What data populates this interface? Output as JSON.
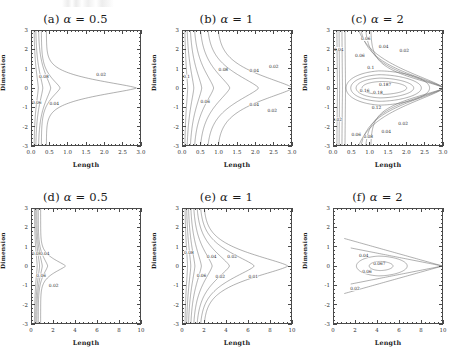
{
  "figure": {
    "axis_titles": {
      "x": "Length",
      "y": "Dimension"
    },
    "panels": [
      {
        "id": "a",
        "tag": "(a)",
        "param_name": "α",
        "param_value": "0.5",
        "title": "(a) α = 0.5",
        "xlim": [
          0.0,
          3.0
        ],
        "ylim": [
          -3,
          3
        ],
        "xticks": [
          "0.0",
          "0.5",
          "1.0",
          "1.5",
          "2.0",
          "2.5",
          "3.0"
        ],
        "xtick_values": [
          0.0,
          0.5,
          1.0,
          1.5,
          2.0,
          2.5,
          3.0
        ],
        "yticks": [
          "3",
          "2",
          "1",
          "0",
          "-1",
          "-2",
          "-3"
        ],
        "ytick_values": [
          3,
          2,
          1,
          0,
          -1,
          -2,
          -3
        ],
        "contour_levels": [
          0.02,
          0.04,
          0.06,
          0.08
        ],
        "labels": [
          {
            "text": "0.08",
            "x": 0.33,
            "y": 0.62
          },
          {
            "text": "0.06",
            "x": 0.13,
            "y": -0.75
          },
          {
            "text": "0.04",
            "x": 0.62,
            "y": -0.82
          },
          {
            "text": "0.02",
            "x": 1.92,
            "y": 0.72
          }
        ]
      },
      {
        "id": "b",
        "tag": "(b)",
        "param_name": "α",
        "param_value": "1",
        "title": "(b) α = 1",
        "xlim": [
          0.0,
          3.0
        ],
        "ylim": [
          -3,
          3
        ],
        "xticks": [
          "0.0",
          "0.5",
          "1.0",
          "1.5",
          "2.0",
          "2.5",
          "3.0"
        ],
        "xtick_values": [
          0.0,
          0.5,
          1.0,
          1.5,
          2.0,
          2.5,
          3.0
        ],
        "yticks": [
          "3",
          "2",
          "1",
          "0",
          "-1",
          "-2",
          "-3"
        ],
        "ytick_values": [
          3,
          2,
          1,
          0,
          -1,
          -2,
          -3
        ],
        "contour_levels": [
          0.02,
          0.04,
          0.06,
          0.08,
          0.1
        ],
        "labels": [
          {
            "text": "0.1",
            "x": 0.1,
            "y": 0.6
          },
          {
            "text": "0.08",
            "x": 1.12,
            "y": 0.95
          },
          {
            "text": "0.06",
            "x": 0.62,
            "y": -0.72
          },
          {
            "text": "0.04",
            "x": 1.98,
            "y": 0.92
          },
          {
            "text": "0.02",
            "x": 2.52,
            "y": 1.12
          },
          {
            "text": "0.04",
            "x": 1.98,
            "y": -0.88
          },
          {
            "text": "0.02",
            "x": 2.48,
            "y": -1.2
          }
        ]
      },
      {
        "id": "c",
        "tag": "(c)",
        "param_name": "α",
        "param_value": "2",
        "title": "(c) α = 2",
        "xlim": [
          0.0,
          3.0
        ],
        "ylim": [
          -3,
          3
        ],
        "xticks": [
          "0.0",
          "0.5",
          "1.0",
          "1.5",
          "2.0",
          "2.5",
          "3.0"
        ],
        "xtick_values": [
          0.0,
          0.5,
          1.0,
          1.5,
          2.0,
          2.5,
          3.0
        ],
        "yticks": [
          "3",
          "2",
          "1",
          "0",
          "-1",
          "-2",
          "-3"
        ],
        "ytick_values": [
          3,
          2,
          1,
          0,
          -1,
          -2,
          -3
        ],
        "contour_levels": [
          0.02,
          0.04,
          0.06,
          0.08,
          0.1,
          0.12,
          0.14,
          0.16,
          0.18,
          0.187
        ],
        "labels": [
          {
            "text": "0.04",
            "x": 0.13,
            "y": 2.05
          },
          {
            "text": "0.02",
            "x": 0.09,
            "y": -1.65
          },
          {
            "text": "0.06",
            "x": 0.88,
            "y": 2.58
          },
          {
            "text": "0.06",
            "x": 0.72,
            "y": 1.72
          },
          {
            "text": "0.04",
            "x": 1.38,
            "y": 2.18
          },
          {
            "text": "0.02",
            "x": 1.95,
            "y": 1.95
          },
          {
            "text": "0.1",
            "x": 1.02,
            "y": 1.08
          },
          {
            "text": "0.16",
            "x": 0.85,
            "y": -0.12
          },
          {
            "text": "0.187",
            "x": 1.42,
            "y": 0.2
          },
          {
            "text": "0.18",
            "x": 1.22,
            "y": -0.25
          },
          {
            "text": "0.12",
            "x": 1.18,
            "y": -1.05
          },
          {
            "text": "0.06",
            "x": 0.62,
            "y": -2.45
          },
          {
            "text": "0.08",
            "x": 0.95,
            "y": -2.58
          },
          {
            "text": "0.04",
            "x": 1.45,
            "y": -2.3
          },
          {
            "text": "0.02",
            "x": 1.92,
            "y": -1.85
          }
        ]
      },
      {
        "id": "d",
        "tag": "(d)",
        "param_name": "α",
        "param_value": "0.5",
        "title": "(d) α = 0.5",
        "xlim": [
          0,
          10
        ],
        "ylim": [
          -3,
          3
        ],
        "xticks": [
          "0",
          "2",
          "4",
          "6",
          "8",
          "10"
        ],
        "xtick_values": [
          0,
          2,
          4,
          6,
          8,
          10
        ],
        "yticks": [
          "3",
          "2",
          "1",
          "0",
          "-1",
          "-2",
          "-3"
        ],
        "ytick_values": [
          3,
          2,
          1,
          0,
          -1,
          -2,
          -3
        ],
        "contour_levels": [
          0.02,
          0.04,
          0.06,
          0.08
        ],
        "labels": [
          {
            "text": "0.08",
            "x": 0.42,
            "y": 0.65
          },
          {
            "text": "0.04",
            "x": 1.18,
            "y": 0.65
          },
          {
            "text": "0.06",
            "x": 0.85,
            "y": -0.5
          },
          {
            "text": "0.02",
            "x": 2.0,
            "y": -1.05
          }
        ]
      },
      {
        "id": "e",
        "tag": "(e)",
        "param_name": "α",
        "param_value": "1",
        "title": "(e) α = 1",
        "xlim": [
          0,
          10
        ],
        "ylim": [
          -3,
          3
        ],
        "xticks": [
          "0",
          "2",
          "4",
          "6",
          "8",
          "10"
        ],
        "xtick_values": [
          0,
          2,
          4,
          6,
          8,
          10
        ],
        "yticks": [
          "3",
          "2",
          "1",
          "0",
          "-1",
          "-2",
          "-3"
        ],
        "ytick_values": [
          3,
          2,
          1,
          0,
          -1,
          -2,
          -3
        ],
        "contour_levels": [
          0.01,
          0.02,
          0.04,
          0.06,
          0.08
        ],
        "labels": [
          {
            "text": "0.08",
            "x": 0.55,
            "y": 0.72
          },
          {
            "text": "0.04",
            "x": 2.65,
            "y": 0.48
          },
          {
            "text": "0.02",
            "x": 4.55,
            "y": 0.5
          },
          {
            "text": "0.06",
            "x": 1.72,
            "y": -0.5
          },
          {
            "text": "0.02",
            "x": 3.45,
            "y": -0.55
          },
          {
            "text": "0.01",
            "x": 6.5,
            "y": -0.55
          }
        ]
      },
      {
        "id": "f",
        "tag": "(f)",
        "param_name": "α",
        "param_value": "2",
        "title": "(f) α = 2",
        "xlim": [
          0,
          10
        ],
        "ylim": [
          -3,
          3
        ],
        "xticks": [
          "0",
          "2",
          "4",
          "6",
          "8",
          "10"
        ],
        "xtick_values": [
          0,
          2,
          4,
          6,
          8,
          10
        ],
        "yticks": [
          "3",
          "2",
          "1",
          "0",
          "-1",
          "-2",
          "-3"
        ],
        "ytick_values": [
          3,
          2,
          1,
          0,
          -1,
          -2,
          -3
        ],
        "contour_levels": [
          0.02,
          0.04,
          0.06,
          0.067
        ],
        "labels": [
          {
            "text": "0.04",
            "x": 2.75,
            "y": 0.55
          },
          {
            "text": "0.067",
            "x": 4.2,
            "y": 0.12
          },
          {
            "text": "0.06",
            "x": 3.05,
            "y": -0.3
          },
          {
            "text": "0.02",
            "x": 1.95,
            "y": -1.2
          }
        ]
      }
    ]
  },
  "chart_data": {
    "type": "line",
    "title": "",
    "xlabel": "Length",
    "ylabel": "Dimension",
    "grid": false,
    "legend_position": "none",
    "panels": [
      {
        "id": "a",
        "title": "(a) α = 0.5",
        "alpha": 0.5,
        "xlim": [
          0.0,
          3.0
        ],
        "ylim": [
          -3,
          3
        ],
        "xticks": [
          0.0,
          0.5,
          1.0,
          1.5,
          2.0,
          2.5,
          3.0
        ],
        "yticks": [
          3,
          2,
          1,
          0,
          -1,
          -2,
          -3
        ],
        "contour_levels": [
          0.02,
          0.04,
          0.06,
          0.08
        ],
        "peak_value": 0.08,
        "peak_location": [
          0.0,
          0.0
        ],
        "outermost_extent_x": 2.9
      },
      {
        "id": "b",
        "title": "(b) α = 1",
        "alpha": 1,
        "xlim": [
          0.0,
          3.0
        ],
        "ylim": [
          -3,
          3
        ],
        "xticks": [
          0.0,
          0.5,
          1.0,
          1.5,
          2.0,
          2.5,
          3.0
        ],
        "yticks": [
          3,
          2,
          1,
          0,
          -1,
          -2,
          -3
        ],
        "contour_levels": [
          0.02,
          0.04,
          0.06,
          0.08,
          0.1
        ],
        "peak_value": 0.1,
        "peak_location": [
          0.1,
          0.0
        ],
        "outermost_extent_x": 3.0
      },
      {
        "id": "c",
        "title": "(c) α = 2",
        "alpha": 2,
        "xlim": [
          0.0,
          3.0
        ],
        "ylim": [
          -3,
          3
        ],
        "xticks": [
          0.0,
          0.5,
          1.0,
          1.5,
          2.0,
          2.5,
          3.0
        ],
        "yticks": [
          3,
          2,
          1,
          0,
          -1,
          -2,
          -3
        ],
        "contour_levels": [
          0.02,
          0.04,
          0.06,
          0.08,
          0.1,
          0.12,
          0.14,
          0.16,
          0.18,
          0.187
        ],
        "peak_value": 0.187,
        "peak_location": [
          1.35,
          0.0
        ],
        "outermost_extent_x": 3.0
      },
      {
        "id": "d",
        "title": "(d) α = 0.5",
        "alpha": 0.5,
        "xlim": [
          0,
          10
        ],
        "ylim": [
          -3,
          3
        ],
        "xticks": [
          0,
          2,
          4,
          6,
          8,
          10
        ],
        "yticks": [
          3,
          2,
          1,
          0,
          -1,
          -2,
          -3
        ],
        "contour_levels": [
          0.02,
          0.04,
          0.06,
          0.08
        ],
        "peak_value": 0.08,
        "peak_location": [
          0.3,
          0.0
        ],
        "outermost_extent_x": 3.1
      },
      {
        "id": "e",
        "title": "(e) α = 1",
        "alpha": 1,
        "xlim": [
          0,
          10
        ],
        "ylim": [
          -3,
          3
        ],
        "xticks": [
          0,
          2,
          4,
          6,
          8,
          10
        ],
        "yticks": [
          3,
          2,
          1,
          0,
          -1,
          -2,
          -3
        ],
        "contour_levels": [
          0.01,
          0.02,
          0.04,
          0.06,
          0.08
        ],
        "peak_value": 0.08,
        "peak_location": [
          0.3,
          0.0
        ],
        "outermost_extent_x": 9.7
      },
      {
        "id": "f",
        "title": "(f) α = 2",
        "alpha": 2,
        "xlim": [
          0,
          10
        ],
        "ylim": [
          -3,
          3
        ],
        "xticks": [
          0,
          2,
          4,
          6,
          8,
          10
        ],
        "yticks": [
          3,
          2,
          1,
          0,
          -1,
          -2,
          -3
        ],
        "contour_levels": [
          0.02,
          0.04,
          0.06,
          0.067
        ],
        "peak_value": 0.067,
        "peak_location": [
          4.3,
          0.0
        ],
        "outermost_extent_x": 10.0
      }
    ]
  }
}
